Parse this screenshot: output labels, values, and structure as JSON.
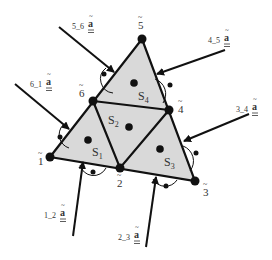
{
  "diagram": {
    "colors": {
      "fill": "#d9d9d9",
      "stroke": "#111111",
      "text": "#333333"
    },
    "nodes": [
      {
        "id": "1",
        "label": "1",
        "x": 50,
        "y": 157,
        "label_x": 38,
        "label_y": 165
      },
      {
        "id": "2",
        "label": "2",
        "x": 120,
        "y": 168,
        "label_x": 117,
        "label_y": 187
      },
      {
        "id": "3",
        "label": "3",
        "x": 195,
        "y": 181,
        "label_x": 203,
        "label_y": 196
      },
      {
        "id": "4",
        "label": "4",
        "x": 169,
        "y": 110,
        "label_x": 178,
        "label_y": 113
      },
      {
        "id": "5",
        "label": "5",
        "x": 142,
        "y": 39,
        "label_x": 138,
        "label_y": 29
      },
      {
        "id": "6",
        "label": "6",
        "x": 93,
        "y": 101,
        "label_x": 79,
        "label_y": 97
      }
    ],
    "subregions": [
      {
        "label": "S",
        "sub": "1",
        "dot_x": 88,
        "dot_y": 140,
        "text_x": 92,
        "text_y": 156
      },
      {
        "label": "S",
        "sub": "2",
        "dot_x": 129,
        "dot_y": 127,
        "text_x": 108,
        "text_y": 124
      },
      {
        "label": "S",
        "sub": "3",
        "dot_x": 160,
        "dot_y": 149,
        "text_x": 164,
        "text_y": 166
      },
      {
        "label": "S",
        "sub": "4",
        "dot_x": 134,
        "dot_y": 83,
        "text_x": 138,
        "text_y": 100
      }
    ],
    "tractions": [
      {
        "label": "5_6",
        "symbol": "a",
        "from": [
          59,
          27
        ],
        "to": [
          114,
          72
        ],
        "label_x": 72,
        "label_y": 29
      },
      {
        "label": "6_1",
        "symbol": "a",
        "from": [
          15,
          84
        ],
        "to": [
          69,
          129
        ],
        "label_x": 30,
        "label_y": 87
      },
      {
        "label": "4_5",
        "symbol": "a",
        "from": [
          225,
          50
        ],
        "to": [
          157,
          74
        ],
        "label_x": 208,
        "label_y": 43
      },
      {
        "label": "3_4",
        "symbol": "a",
        "from": [
          249,
          114
        ],
        "to": [
          184,
          141
        ],
        "label_x": 236,
        "label_y": 112
      },
      {
        "label": "1_2",
        "symbol": "a",
        "from": [
          73,
          236
        ],
        "to": [
          83,
          162
        ],
        "label_x": 44,
        "label_y": 218
      },
      {
        "label": "2_3",
        "symbol": "a",
        "from": [
          146,
          247
        ],
        "to": [
          156,
          177
        ],
        "label_x": 118,
        "label_y": 240
      }
    ]
  }
}
